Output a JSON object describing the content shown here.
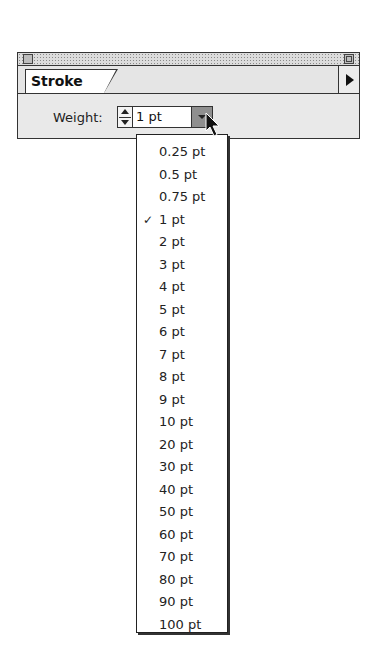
{
  "panel": {
    "tab_label": "Stroke",
    "weight_label": "Weight:",
    "weight_value": "1 pt"
  },
  "menu": {
    "selected": "1 pt",
    "check_glyph": "✓",
    "items": [
      "0.25 pt",
      "0.5 pt",
      "0.75 pt",
      "1 pt",
      "2 pt",
      "3 pt",
      "4 pt",
      "5 pt",
      "6 pt",
      "7 pt",
      "8 pt",
      "9 pt",
      "10 pt",
      "20 pt",
      "30 pt",
      "40 pt",
      "50 pt",
      "60 pt",
      "70 pt",
      "80 pt",
      "90 pt",
      "100 pt"
    ]
  }
}
